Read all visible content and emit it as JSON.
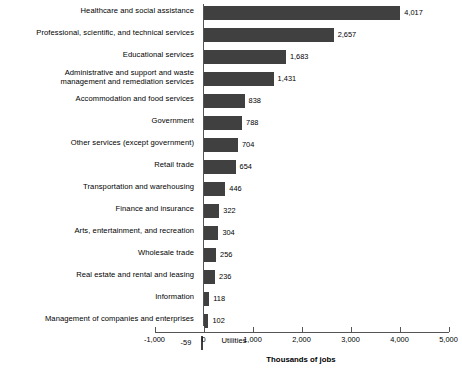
{
  "chart_data": {
    "type": "bar",
    "orientation": "horizontal",
    "title": "",
    "xlabel": "Thousands of jobs",
    "ylabel": "",
    "xlim": [
      -1000,
      5000
    ],
    "xticks": [
      "-1,000",
      "0",
      "1,000",
      "2,000",
      "3,000",
      "4,000",
      "5,000"
    ],
    "xtick_values": [
      -1000,
      0,
      1000,
      2000,
      3000,
      4000,
      5000
    ],
    "grid": false,
    "legend": false,
    "bar_color": "#404040",
    "axis_color": "#555555",
    "categories": [
      "Healthcare and social assistance",
      "Professional, scientific, and technical services",
      "Educational services",
      "Administrative and support and waste\nmanagement and remediation services",
      "Accommodation and food services",
      "Government",
      "Other services (except government)",
      "Retail trade",
      "Transportation and warehousing",
      "Finance and insurance",
      "Arts, entertainment, and recreation",
      "Wholesale trade",
      "Real estate and rental and leasing",
      "Information",
      "Management of companies and enterprises",
      "Utilities"
    ],
    "values": [
      4017,
      2657,
      1683,
      1431,
      838,
      788,
      704,
      654,
      446,
      322,
      304,
      256,
      236,
      118,
      102,
      -59
    ],
    "value_labels": [
      "4,017",
      "2,657",
      "1,683",
      "1,431",
      "838",
      "788",
      "704",
      "654",
      "446",
      "322",
      "304",
      "256",
      "236",
      "118",
      "102",
      "-59"
    ]
  }
}
